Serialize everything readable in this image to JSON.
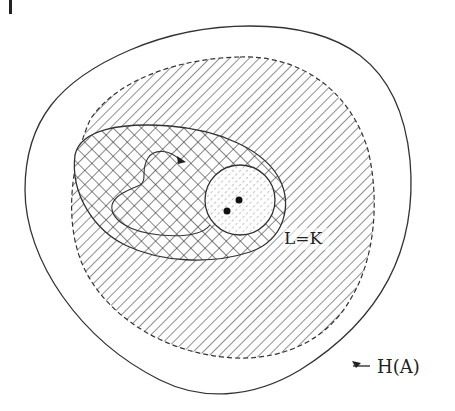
{
  "diagram": {
    "labels": {
      "inner_region": "L=K",
      "outer_region": "H(A)"
    },
    "regions": [
      {
        "name": "outer-boundary",
        "style": "solid outline, no fill"
      },
      {
        "name": "hatched-region",
        "style": "dashed outline, diagonal hatch"
      },
      {
        "name": "crosshatched-region",
        "style": "solid outline, cross hatch"
      },
      {
        "name": "circle-region",
        "style": "solid outline, dotted hatch",
        "points": 2
      }
    ],
    "colors": {
      "line": "#222222",
      "background": "#ffffff"
    }
  }
}
